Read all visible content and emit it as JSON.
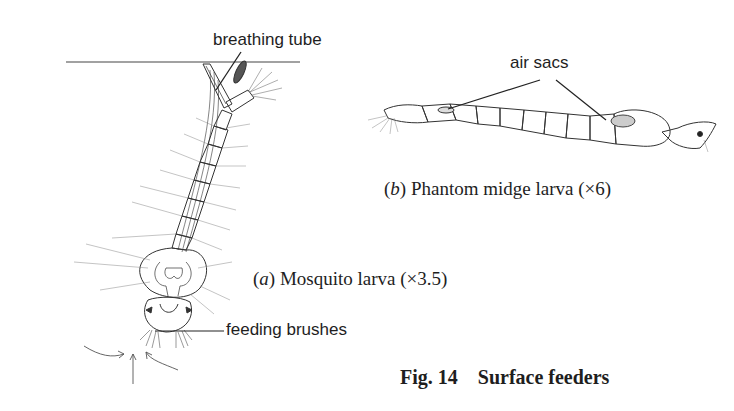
{
  "figure": {
    "number_label": "Fig. 14",
    "title": "Surface feeders"
  },
  "panel_a": {
    "letter": "a",
    "name": "Mosquito larva",
    "magnification": "(×3.5)",
    "labels": {
      "breathing_tube": "breathing tube",
      "feeding_brushes": "feeding brushes"
    }
  },
  "panel_b": {
    "letter": "b",
    "name": "Phantom midge larva",
    "magnification": "(×6)",
    "labels": {
      "air_sacs": "air sacs"
    }
  },
  "colors": {
    "background": "#ffffff",
    "ink": "#222222"
  }
}
